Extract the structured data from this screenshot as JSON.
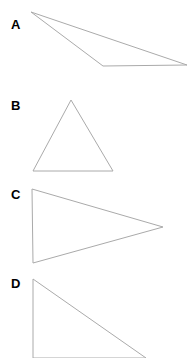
{
  "figure": {
    "background_color": "#ffffff",
    "stroke_color": "#aaaaaa",
    "stroke_width": 1,
    "label_color": "#000000",
    "width": 187,
    "height": 358,
    "shapes": [
      {
        "label": "A",
        "name": "triangle-a",
        "description": "very thin obtuse triangle pointing left, wide and flat",
        "points": "31,12 187,65 103,66",
        "clipped": true
      },
      {
        "label": "B",
        "name": "triangle-b",
        "description": "upright isosceles triangle, apex at top",
        "points": "71,100 113,171 33,171",
        "clipped": false
      },
      {
        "label": "C",
        "name": "triangle-c",
        "description": "triangle pointing right, vertical left edge",
        "points": "32,189 163,227 33,263",
        "clipped": false
      },
      {
        "label": "D",
        "name": "triangle-d",
        "description": "right triangle with vertical left edge, cut off by bottom of image",
        "points": "33,279 146,358 33,358",
        "clipped": true
      }
    ]
  }
}
